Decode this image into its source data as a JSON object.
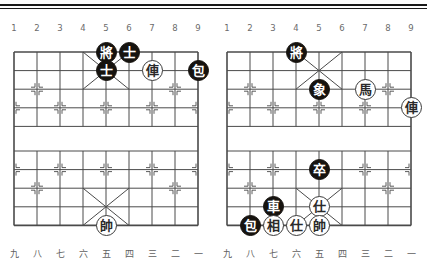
{
  "page": {
    "board_count": 2,
    "background_color": "#ffffff",
    "line_color": "#4a4a4a",
    "black_piece_color": "#16130f",
    "red_piece_color": "#ffffff"
  },
  "top_rules": {
    "rule_a": "horizontal-rule",
    "rule_b": "horizontal-rule"
  },
  "column_labels_top": [
    "1",
    "2",
    "3",
    "4",
    "5",
    "6",
    "7",
    "8",
    "9"
  ],
  "column_labels_bottom": [
    "九",
    "八",
    "七",
    "六",
    "五",
    "四",
    "三",
    "二",
    "一"
  ],
  "boards": [
    {
      "id": "board-left",
      "name": "left-board",
      "pieces": [
        {
          "glyph": "將",
          "side": "black",
          "file": 5,
          "rank": 1,
          "name": "black-general"
        },
        {
          "glyph": "士",
          "side": "black",
          "file": 6,
          "rank": 1,
          "name": "black-advisor-1"
        },
        {
          "glyph": "士",
          "side": "black",
          "file": 5,
          "rank": 2,
          "name": "black-advisor-2"
        },
        {
          "glyph": "俥",
          "side": "red",
          "file": 7,
          "rank": 2,
          "name": "red-chariot"
        },
        {
          "glyph": "包",
          "side": "black",
          "file": 9,
          "rank": 2,
          "name": "black-cannon"
        },
        {
          "glyph": "帥",
          "side": "red",
          "file": 5,
          "rank": 10,
          "name": "red-general"
        }
      ]
    },
    {
      "id": "board-right",
      "name": "right-board",
      "pieces": [
        {
          "glyph": "將",
          "side": "black",
          "file": 4,
          "rank": 1,
          "name": "black-general"
        },
        {
          "glyph": "象",
          "side": "black",
          "file": 5,
          "rank": 3,
          "name": "black-elephant"
        },
        {
          "glyph": "馬",
          "side": "red",
          "file": 7,
          "rank": 3,
          "name": "red-horse"
        },
        {
          "glyph": "俥",
          "side": "red",
          "file": 9,
          "rank": 4,
          "name": "red-chariot"
        },
        {
          "glyph": "卒",
          "side": "black",
          "file": 5,
          "rank": 7,
          "name": "black-pawn"
        },
        {
          "glyph": "車",
          "side": "black",
          "file": 3,
          "rank": 9,
          "name": "black-chariot"
        },
        {
          "glyph": "仕",
          "side": "red",
          "file": 5,
          "rank": 9,
          "name": "red-advisor-1"
        },
        {
          "glyph": "包",
          "side": "black",
          "file": 2,
          "rank": 10,
          "name": "black-cannon"
        },
        {
          "glyph": "相",
          "side": "red",
          "file": 3,
          "rank": 10,
          "name": "red-minister"
        },
        {
          "glyph": "仕",
          "side": "red",
          "file": 4,
          "rank": 10,
          "name": "red-advisor-2"
        },
        {
          "glyph": "帥",
          "side": "red",
          "file": 5,
          "rank": 10,
          "name": "red-general"
        }
      ]
    }
  ]
}
